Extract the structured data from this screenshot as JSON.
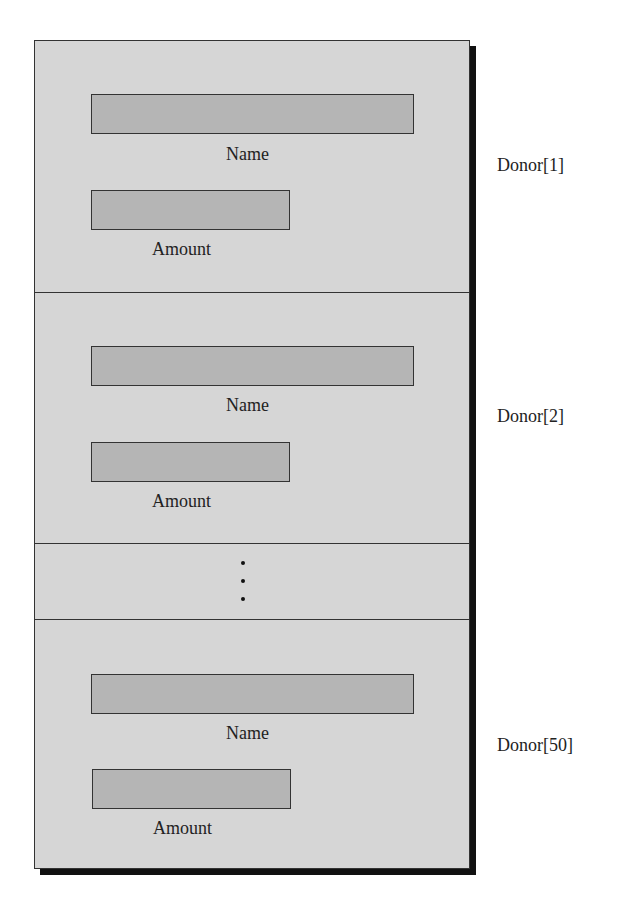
{
  "diagram": {
    "title": "",
    "records": [
      {
        "label": "Donor[1]",
        "fields": [
          {
            "name": "Name"
          },
          {
            "name": "Amount"
          }
        ]
      },
      {
        "label": "Donor[2]",
        "fields": [
          {
            "name": "Name"
          },
          {
            "name": "Amount"
          }
        ]
      },
      {
        "label": "Donor[50]",
        "fields": [
          {
            "name": "Name"
          },
          {
            "name": "Amount"
          }
        ]
      }
    ],
    "ellipsis": "vertical-dots",
    "colors": {
      "record_bg": "#d6d6d6",
      "field_bg": "#b5b5b5",
      "border": "#333333",
      "shadow": "#111111"
    }
  }
}
